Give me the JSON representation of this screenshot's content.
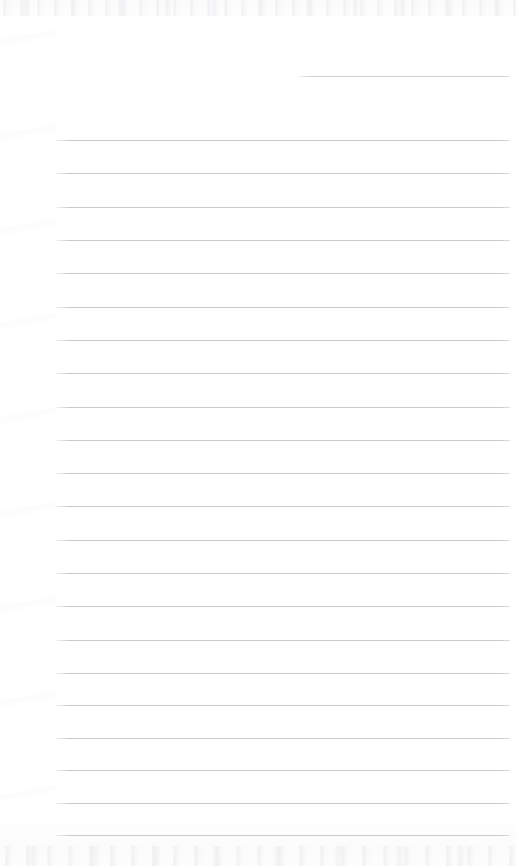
{
  "document": {
    "kind": "scanned-blank-lined-notepad-page",
    "page_width": 516,
    "page_height": 866,
    "background_color": "#fefefe",
    "paper_tint": "#ffffff",
    "has_handwriting": false,
    "has_printed_text": false,
    "text_content": "",
    "orientation": "portrait"
  },
  "ruling": {
    "line_color": "#c9c9ce",
    "line_thickness_px": 1,
    "line_spacing_px": 33.3,
    "left_margin_x": 56,
    "right_edge_x": 510,
    "full_line_count": 22,
    "partial_line_count": 1,
    "first_full_line_y": 140,
    "last_full_line_y": 835,
    "lines": [
      {
        "id": "rule-partial-1",
        "y": 76,
        "x_start": 298,
        "x_end": 510,
        "type": "partial",
        "color": "#cdcdd2"
      },
      {
        "id": "rule-1",
        "y": 140,
        "x_start": 56,
        "x_end": 510,
        "type": "full",
        "color": "#c9c9ce"
      },
      {
        "id": "rule-2",
        "y": 173,
        "x_start": 56,
        "x_end": 510,
        "type": "full",
        "color": "#c9c9ce"
      },
      {
        "id": "rule-3",
        "y": 207,
        "x_start": 56,
        "x_end": 510,
        "type": "full",
        "color": "#c9c9ce"
      },
      {
        "id": "rule-4",
        "y": 240,
        "x_start": 56,
        "x_end": 510,
        "type": "full",
        "color": "#c9c9ce"
      },
      {
        "id": "rule-5",
        "y": 273,
        "x_start": 56,
        "x_end": 510,
        "type": "full",
        "color": "#c9c9ce"
      },
      {
        "id": "rule-6",
        "y": 307,
        "x_start": 56,
        "x_end": 510,
        "type": "full",
        "color": "#c9c9ce"
      },
      {
        "id": "rule-7",
        "y": 340,
        "x_start": 56,
        "x_end": 510,
        "type": "full",
        "color": "#c9c9ce"
      },
      {
        "id": "rule-8",
        "y": 373,
        "x_start": 56,
        "x_end": 510,
        "type": "full",
        "color": "#c9c9ce"
      },
      {
        "id": "rule-9",
        "y": 407,
        "x_start": 56,
        "x_end": 510,
        "type": "full",
        "color": "#c9c9ce"
      },
      {
        "id": "rule-10",
        "y": 440,
        "x_start": 56,
        "x_end": 510,
        "type": "full",
        "color": "#c9c9ce"
      },
      {
        "id": "rule-11",
        "y": 473,
        "x_start": 56,
        "x_end": 510,
        "type": "full",
        "color": "#c9c9ce"
      },
      {
        "id": "rule-12",
        "y": 506,
        "x_start": 56,
        "x_end": 510,
        "type": "full",
        "color": "#c9c9ce"
      },
      {
        "id": "rule-13",
        "y": 540,
        "x_start": 56,
        "x_end": 510,
        "type": "full",
        "color": "#c9c9ce"
      },
      {
        "id": "rule-14",
        "y": 573,
        "x_start": 56,
        "x_end": 510,
        "type": "full",
        "color": "#c9c9ce"
      },
      {
        "id": "rule-15",
        "y": 606,
        "x_start": 56,
        "x_end": 510,
        "type": "full",
        "color": "#c9c9ce"
      },
      {
        "id": "rule-16",
        "y": 640,
        "x_start": 56,
        "x_end": 510,
        "type": "full",
        "color": "#c9c9ce"
      },
      {
        "id": "rule-17",
        "y": 673,
        "x_start": 56,
        "x_end": 510,
        "type": "full",
        "color": "#c9c9ce"
      },
      {
        "id": "rule-18",
        "y": 705,
        "x_start": 56,
        "x_end": 510,
        "type": "full",
        "color": "#c9c9ce"
      },
      {
        "id": "rule-19",
        "y": 738,
        "x_start": 56,
        "x_end": 510,
        "type": "full",
        "color": "#c9c9ce"
      },
      {
        "id": "rule-20",
        "y": 770,
        "x_start": 56,
        "x_end": 510,
        "type": "full",
        "color": "#c9c9ce"
      },
      {
        "id": "rule-21",
        "y": 803,
        "x_start": 56,
        "x_end": 510,
        "type": "full",
        "color": "#c9c9ce"
      },
      {
        "id": "rule-22",
        "y": 835,
        "x_start": 56,
        "x_end": 510,
        "type": "full",
        "color": "#c9c9ce"
      }
    ]
  },
  "scan_artifacts": {
    "top_noise_band": {
      "y": 0,
      "height": 16,
      "color": "#e4e4e9"
    },
    "bottom_noise_band": {
      "y": 846,
      "height": 20,
      "color": "#e4e4e9"
    },
    "left_margin_mottle": {
      "x": 0,
      "width": 56,
      "color": "#f2f2f5"
    }
  }
}
